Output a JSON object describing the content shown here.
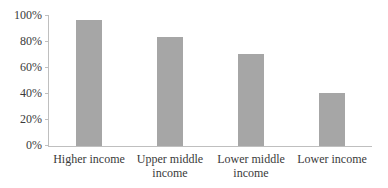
{
  "chart_data": {
    "type": "bar",
    "title": "",
    "xlabel": "",
    "ylabel": "",
    "categories": [
      "Higher income",
      "Upper middle income",
      "Lower middle income",
      "Lower income"
    ],
    "values": [
      97,
      84,
      71,
      41
    ],
    "ylim": [
      0,
      100
    ],
    "y_ticks": [
      "0%",
      "20%",
      "40%",
      "60%",
      "80%",
      "100%"
    ],
    "grid": false,
    "legend": null,
    "bar_color": "#a6a6a6"
  },
  "axis": {
    "y_labels": [
      "100%",
      "80%",
      "60%",
      "40%",
      "20%",
      "0%"
    ]
  },
  "labels": {
    "cat0": "Higher income",
    "cat1_line1": "Upper middle",
    "cat1_line2": "income",
    "cat2_line1": "Lower middle",
    "cat2_line2": "income",
    "cat3": "Lower income"
  }
}
